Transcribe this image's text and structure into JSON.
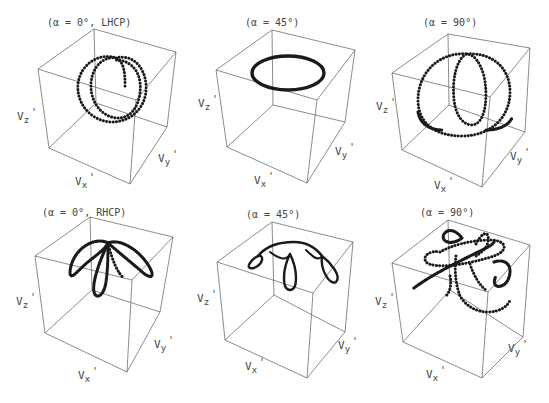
{
  "figure": {
    "panels": [
      {
        "id": "p1",
        "title": "(α = 0°, LHCP)",
        "axes": {
          "x": "V",
          "x_sub": "x",
          "y": "V",
          "y_sub": "y",
          "z": "V",
          "z_sub": "z",
          "prime": "'"
        },
        "curve": "dotted spiral loops (LHCP, α=0°)"
      },
      {
        "id": "p2",
        "title": "(α = 45°)",
        "axes": {
          "x": "V",
          "x_sub": "x",
          "y": "V",
          "y_sub": "y",
          "z": "V",
          "z_sub": "z",
          "prime": "'"
        },
        "curve": "closed ellipse near top"
      },
      {
        "id": "p3",
        "title": "(α = 90°)",
        "axes": {
          "x": "V",
          "x_sub": "x",
          "y": "V",
          "y_sub": "y",
          "z": "V",
          "z_sub": "z",
          "prime": "'"
        },
        "curve": "dotted nested loops"
      },
      {
        "id": "p4",
        "title": "(α = 0°, RHCP)",
        "axes": {
          "x": "V",
          "x_sub": "x",
          "y": "V",
          "y_sub": "y",
          "z": "V",
          "z_sub": "z",
          "prime": "'"
        },
        "curve": "three-petal loops (RHCP, α=0°)"
      },
      {
        "id": "p5",
        "title": "(α = 45°)",
        "axes": {
          "x": "V",
          "x_sub": "x",
          "y": "V",
          "y_sub": "y",
          "z": "V",
          "z_sub": "z",
          "prime": "'"
        },
        "curve": "arch with three small loops"
      },
      {
        "id": "p6",
        "title": "(α = 90°)",
        "axes": {
          "x": "V",
          "x_sub": "x",
          "y": "V",
          "y_sub": "y",
          "z": "V",
          "z_sub": "z",
          "prime": "'"
        },
        "curve": "tangled dotted loops"
      }
    ]
  }
}
